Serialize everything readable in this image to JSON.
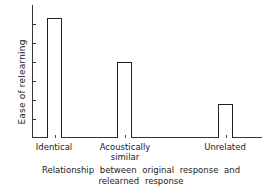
{
  "chart_data": {
    "type": "bar",
    "title": "",
    "xlabel": "Relationship between original response and relearned response",
    "xlabel_lines": [
      "Relationship between original response and",
      "relearned response"
    ],
    "ylabel": "Ease of relearning",
    "categories": [
      "Identical",
      "Acoustically similar",
      "Unrelated"
    ],
    "category_lines": [
      [
        "Identical"
      ],
      [
        "Acoustically",
        "similar"
      ],
      [
        "Unrelated"
      ]
    ],
    "values": [
      6.3,
      4.0,
      1.8
    ],
    "ylim": [
      0,
      7
    ],
    "y_tick_count": 6,
    "y_tick_labels": [],
    "grid": false,
    "legend": null,
    "bar_style": "outline"
  }
}
